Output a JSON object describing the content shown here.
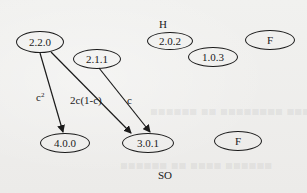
{
  "diagram": {
    "nodes": [
      {
        "id": "n220",
        "label": "2.2.0",
        "cx": 40,
        "cy": 42,
        "w": 48,
        "h": 22
      },
      {
        "id": "n211",
        "label": "2.1.1",
        "cx": 97,
        "cy": 59,
        "w": 48,
        "h": 20
      },
      {
        "id": "n202",
        "label": "2.0.2",
        "cx": 170,
        "cy": 41,
        "w": 46,
        "h": 18
      },
      {
        "id": "n103",
        "label": "1.0.3",
        "cx": 213,
        "cy": 57,
        "w": 50,
        "h": 20
      },
      {
        "id": "nFtop",
        "label": "F",
        "cx": 245,
        "cy": 41,
        "w": 50,
        "h": 20
      },
      {
        "id": "n400",
        "label": "4.0.0",
        "cx": 65,
        "cy": 143,
        "w": 50,
        "h": 20
      },
      {
        "id": "n301",
        "label": "3.0.1",
        "cx": 146,
        "cy": 143,
        "w": 52,
        "h": 20
      },
      {
        "id": "nFbot",
        "label": "F",
        "cx": 238,
        "cy": 141,
        "w": 48,
        "h": 20
      }
    ],
    "edges": [
      {
        "from": "2.2.0",
        "to": "4.0.0",
        "label": "c²"
      },
      {
        "from": "2.2.0",
        "to": "3.0.1",
        "label": "2c(1-c)"
      },
      {
        "from": "2.1.1",
        "to": "3.0.1",
        "label": "c"
      }
    ],
    "edge_labels": {
      "c_squared": "c",
      "c_squared_exp": "2",
      "two_c_one_minus_c": "2c(1-c)",
      "c": "c"
    },
    "region_labels": {
      "top": "H",
      "bottom": "SO"
    }
  }
}
